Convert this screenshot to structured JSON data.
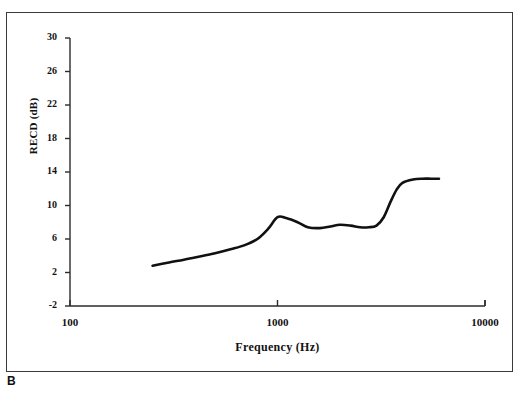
{
  "figure": {
    "panel_letter": "B",
    "top_artifact": "",
    "frame_color": "#3a3a3a"
  },
  "chart_data": {
    "type": "line",
    "title": "",
    "xlabel": "Frequency (Hz)",
    "ylabel": "RECD (dB)",
    "xscale": "log",
    "xlim": [
      100,
      10000
    ],
    "ylim": [
      -2,
      30
    ],
    "yticks": [
      30,
      26,
      22,
      18,
      14,
      10,
      6,
      2,
      -2
    ],
    "xticks": [
      100,
      1000,
      10000
    ],
    "xtick_labels": [
      "100",
      "1000",
      "10000"
    ],
    "grid": false,
    "legend": null,
    "line_color": "#111111",
    "line_width": 2.6,
    "series": [
      {
        "name": "RECD",
        "x": [
          250,
          300,
          350,
          400,
          500,
          600,
          700,
          800,
          900,
          1000,
          1100,
          1250,
          1400,
          1600,
          1800,
          2000,
          2250,
          2500,
          2750,
          3000,
          3250,
          3500,
          3750,
          4000,
          4500,
          5000,
          5500,
          6000
        ],
        "y": [
          2.8,
          3.2,
          3.5,
          3.8,
          4.3,
          4.8,
          5.3,
          6.0,
          7.2,
          8.6,
          8.5,
          8.0,
          7.4,
          7.3,
          7.5,
          7.7,
          7.6,
          7.4,
          7.4,
          7.6,
          8.6,
          10.4,
          11.9,
          12.7,
          13.1,
          13.2,
          13.2,
          13.2
        ]
      }
    ]
  }
}
